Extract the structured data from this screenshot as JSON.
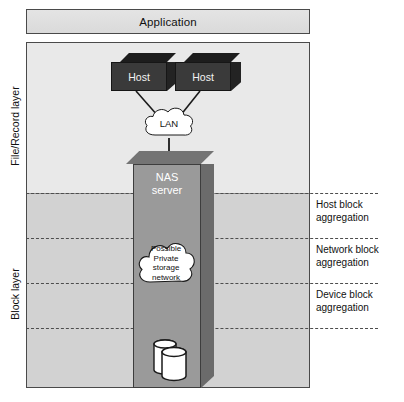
{
  "diagram": {
    "application_bar": {
      "label": "Application"
    },
    "layers": [
      {
        "id": "file-record",
        "label": "File/Record layer"
      },
      {
        "id": "block",
        "label": "Block layer"
      }
    ],
    "aggregation_labels": [
      {
        "id": "host-block",
        "line1": "Host block",
        "line2": "aggregation"
      },
      {
        "id": "network-block",
        "line1": "Network block",
        "line2": "aggregation"
      },
      {
        "id": "device-block",
        "line1": "Device block",
        "line2": "aggregation"
      }
    ],
    "hosts": [
      {
        "id": "host-1",
        "label": "Host"
      },
      {
        "id": "host-2",
        "label": "Host"
      }
    ],
    "lan_cloud": {
      "label": "LAN"
    },
    "nas_server": {
      "line1": "NAS",
      "line2": "server"
    },
    "storage_network_cloud": {
      "line1": "Possible",
      "line2": "Private",
      "line3": "storage",
      "line4": "network"
    },
    "storage_devices": {
      "name": "disk-array"
    },
    "colors": {
      "file_layer_fill": "#e9e9e9",
      "block_layer_fill": "#d2d2d2",
      "host_face": "#3a3a3a",
      "nas_face": "#9a9a9a",
      "frame_stroke": "#4a4a4a",
      "dashed_line": "#4d4d4d",
      "cloud_fill": "#ffffff"
    }
  }
}
